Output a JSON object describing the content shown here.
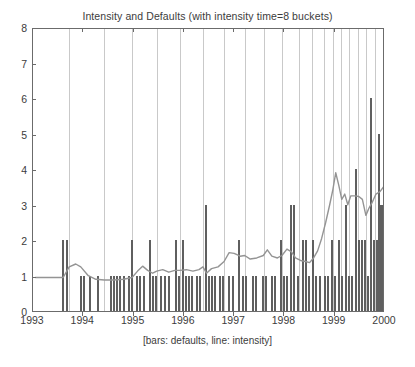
{
  "chart_data": {
    "type": "bar",
    "title": "Intensity and Defaults (with intensity time=8 buckets)",
    "xlabel": "[bars: defaults, line: intensity]",
    "ylabel": "",
    "xlim": [
      1993,
      2000
    ],
    "ylim": [
      0,
      8
    ],
    "grid": false,
    "legend": "none",
    "legend_note": "bars: defaults, line: intensity",
    "x_ticks": [
      1993,
      1994,
      1995,
      1996,
      1997,
      1998,
      1999,
      2000
    ],
    "x_tick_labels": [
      "1993",
      "1994",
      "1995",
      "1996",
      "1997",
      "1998",
      "1999",
      "2000"
    ],
    "y_ticks": [
      0,
      1,
      2,
      3,
      4,
      5,
      6,
      7,
      8
    ],
    "y_tick_labels": [
      "0",
      "1",
      "2",
      "3",
      "4",
      "5",
      "6",
      "7",
      "8"
    ],
    "colors": {
      "bar": "#5f5f5f",
      "line": "#949494",
      "bucket_line": "#c9c9c9",
      "axis": "#6b6b6b",
      "text": "#3c3c3c",
      "background": "#ffffff"
    },
    "bucket_boundaries": [
      1993.72,
      1994.42,
      1994.97,
      1995.46,
      1995.92,
      1996.38,
      1996.8,
      1997.21,
      1997.6,
      1997.95,
      1998.28,
      1998.55,
      1998.78,
      1998.96,
      1999.12,
      1999.29,
      1999.46,
      1999.63,
      1999.8
    ],
    "series": [
      {
        "name": "defaults",
        "type": "bar",
        "points": [
          [
            1993.6,
            2
          ],
          [
            1993.67,
            2
          ],
          [
            1993.96,
            1
          ],
          [
            1994.02,
            1
          ],
          [
            1994.13,
            1
          ],
          [
            1994.3,
            1
          ],
          [
            1994.56,
            1
          ],
          [
            1994.62,
            1
          ],
          [
            1994.68,
            1
          ],
          [
            1994.74,
            1
          ],
          [
            1994.8,
            1
          ],
          [
            1994.9,
            1
          ],
          [
            1994.96,
            2
          ],
          [
            1995.06,
            1
          ],
          [
            1995.12,
            1
          ],
          [
            1995.2,
            1
          ],
          [
            1995.32,
            2
          ],
          [
            1995.38,
            1
          ],
          [
            1995.44,
            1
          ],
          [
            1995.55,
            1
          ],
          [
            1995.62,
            1
          ],
          [
            1995.7,
            1
          ],
          [
            1995.84,
            2
          ],
          [
            1995.9,
            1
          ],
          [
            1995.98,
            2
          ],
          [
            1996.04,
            1
          ],
          [
            1996.1,
            1
          ],
          [
            1996.16,
            1
          ],
          [
            1996.26,
            1
          ],
          [
            1996.33,
            1
          ],
          [
            1996.44,
            3
          ],
          [
            1996.5,
            1
          ],
          [
            1996.56,
            1
          ],
          [
            1996.62,
            1
          ],
          [
            1996.72,
            1
          ],
          [
            1996.78,
            1
          ],
          [
            1996.9,
            1
          ],
          [
            1996.98,
            1
          ],
          [
            1997.1,
            2
          ],
          [
            1997.17,
            1
          ],
          [
            1997.24,
            1
          ],
          [
            1997.38,
            1
          ],
          [
            1997.44,
            1
          ],
          [
            1997.58,
            1
          ],
          [
            1997.64,
            1
          ],
          [
            1997.76,
            1
          ],
          [
            1997.82,
            1
          ],
          [
            1997.94,
            2
          ],
          [
            1998.0,
            1
          ],
          [
            1998.06,
            1
          ],
          [
            1998.14,
            3
          ],
          [
            1998.2,
            3
          ],
          [
            1998.26,
            1
          ],
          [
            1998.36,
            2
          ],
          [
            1998.42,
            2
          ],
          [
            1998.48,
            1
          ],
          [
            1998.57,
            2
          ],
          [
            1998.63,
            1
          ],
          [
            1998.7,
            1
          ],
          [
            1998.8,
            1
          ],
          [
            1998.86,
            1
          ],
          [
            1998.94,
            2
          ],
          [
            1999.0,
            1
          ],
          [
            1999.08,
            2
          ],
          [
            1999.14,
            1
          ],
          [
            1999.22,
            3
          ],
          [
            1999.28,
            1
          ],
          [
            1999.34,
            1
          ],
          [
            1999.42,
            4
          ],
          [
            1999.48,
            2
          ],
          [
            1999.54,
            2
          ],
          [
            1999.6,
            2
          ],
          [
            1999.66,
            1
          ],
          [
            1999.72,
            6
          ],
          [
            1999.78,
            2
          ],
          [
            1999.84,
            2
          ],
          [
            1999.88,
            5
          ],
          [
            1999.92,
            3
          ],
          [
            1999.96,
            3
          ]
        ]
      },
      {
        "name": "intensity",
        "type": "line",
        "points": [
          [
            1993.05,
            1.0
          ],
          [
            1993.4,
            1.0
          ],
          [
            1993.6,
            1.0
          ],
          [
            1993.72,
            1.3
          ],
          [
            1993.85,
            1.38
          ],
          [
            1993.95,
            1.3
          ],
          [
            1994.1,
            1.05
          ],
          [
            1994.25,
            0.95
          ],
          [
            1994.42,
            0.93
          ],
          [
            1994.6,
            0.93
          ],
          [
            1994.8,
            0.95
          ],
          [
            1994.97,
            1.0
          ],
          [
            1995.08,
            1.18
          ],
          [
            1995.18,
            1.32
          ],
          [
            1995.28,
            1.2
          ],
          [
            1995.38,
            1.12
          ],
          [
            1995.46,
            1.18
          ],
          [
            1995.58,
            1.22
          ],
          [
            1995.7,
            1.15
          ],
          [
            1995.82,
            1.2
          ],
          [
            1995.92,
            1.2
          ],
          [
            1996.05,
            1.22
          ],
          [
            1996.18,
            1.18
          ],
          [
            1996.3,
            1.22
          ],
          [
            1996.38,
            1.3
          ],
          [
            1996.45,
            1.12
          ],
          [
            1996.55,
            1.25
          ],
          [
            1996.68,
            1.3
          ],
          [
            1996.8,
            1.45
          ],
          [
            1996.9,
            1.7
          ],
          [
            1997.0,
            1.68
          ],
          [
            1997.12,
            1.6
          ],
          [
            1997.21,
            1.62
          ],
          [
            1997.32,
            1.52
          ],
          [
            1997.45,
            1.55
          ],
          [
            1997.58,
            1.62
          ],
          [
            1997.66,
            1.78
          ],
          [
            1997.75,
            1.6
          ],
          [
            1997.86,
            1.55
          ],
          [
            1997.95,
            1.62
          ],
          [
            1998.05,
            1.8
          ],
          [
            1998.14,
            1.72
          ],
          [
            1998.22,
            1.55
          ],
          [
            1998.32,
            1.48
          ],
          [
            1998.42,
            1.45
          ],
          [
            1998.5,
            1.42
          ],
          [
            1998.58,
            1.55
          ],
          [
            1998.66,
            1.75
          ],
          [
            1998.74,
            2.1
          ],
          [
            1998.82,
            2.55
          ],
          [
            1998.9,
            3.05
          ],
          [
            1998.96,
            3.45
          ],
          [
            1999.02,
            3.95
          ],
          [
            1999.08,
            3.6
          ],
          [
            1999.14,
            3.2
          ],
          [
            1999.2,
            3.35
          ],
          [
            1999.26,
            3.05
          ],
          [
            1999.32,
            3.3
          ],
          [
            1999.4,
            3.3
          ],
          [
            1999.48,
            3.28
          ],
          [
            1999.55,
            3.2
          ],
          [
            1999.62,
            2.75
          ],
          [
            1999.68,
            2.95
          ],
          [
            1999.74,
            3.1
          ],
          [
            1999.82,
            3.35
          ],
          [
            1999.9,
            3.42
          ],
          [
            1999.97,
            3.55
          ]
        ]
      }
    ]
  }
}
